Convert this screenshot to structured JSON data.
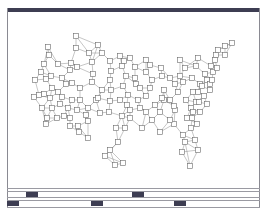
{
  "colors": {
    "frame": "#8a8a92",
    "bar": "#3d3d52",
    "node_stroke": "#6a6a6a",
    "edge": "#8c8c8c"
  },
  "nodes": [
    [
      76,
      36
    ],
    [
      48,
      47
    ],
    [
      49,
      55
    ],
    [
      44,
      64
    ],
    [
      41,
      72
    ],
    [
      35,
      80
    ],
    [
      46,
      79
    ],
    [
      51,
      76
    ],
    [
      62,
      78
    ],
    [
      66,
      84
    ],
    [
      52,
      88
    ],
    [
      34,
      97
    ],
    [
      44,
      94
    ],
    [
      50,
      98
    ],
    [
      58,
      92
    ],
    [
      62,
      97
    ],
    [
      72,
      100
    ],
    [
      72,
      83
    ],
    [
      70,
      70
    ],
    [
      77,
      67
    ],
    [
      76,
      48
    ],
    [
      71,
      63
    ],
    [
      89,
      53
    ],
    [
      98,
      45
    ],
    [
      102,
      53
    ],
    [
      92,
      62
    ],
    [
      93,
      74
    ],
    [
      92,
      82
    ],
    [
      80,
      88
    ],
    [
      80,
      100
    ],
    [
      96,
      100
    ],
    [
      102,
      90
    ],
    [
      100,
      113
    ],
    [
      98,
      98
    ],
    [
      88,
      108
    ],
    [
      77,
      110
    ],
    [
      68,
      108
    ],
    [
      60,
      104
    ],
    [
      52,
      108
    ],
    [
      47,
      118
    ],
    [
      46,
      124
    ],
    [
      57,
      118
    ],
    [
      64,
      116
    ],
    [
      70,
      118
    ],
    [
      78,
      126
    ],
    [
      70,
      126
    ],
    [
      88,
      121
    ],
    [
      110,
      61
    ],
    [
      111,
      71
    ],
    [
      110,
      80
    ],
    [
      111,
      90
    ],
    [
      110,
      101
    ],
    [
      109,
      112
    ],
    [
      120,
      56
    ],
    [
      124,
      61
    ],
    [
      130,
      58
    ],
    [
      122,
      66
    ],
    [
      126,
      76
    ],
    [
      123,
      86
    ],
    [
      128,
      95
    ],
    [
      127,
      105
    ],
    [
      122,
      116
    ],
    [
      136,
      84
    ],
    [
      146,
      60
    ],
    [
      135,
      78
    ],
    [
      146,
      72
    ],
    [
      135,
      67
    ],
    [
      161,
      68
    ],
    [
      146,
      96
    ],
    [
      150,
      88
    ],
    [
      152,
      80
    ],
    [
      155,
      105
    ],
    [
      160,
      112
    ],
    [
      170,
      100
    ],
    [
      175,
      84
    ],
    [
      183,
      82
    ],
    [
      178,
      92
    ],
    [
      162,
      76
    ],
    [
      170,
      78
    ],
    [
      180,
      76
    ],
    [
      185,
      68
    ],
    [
      198,
      58
    ],
    [
      192,
      78
    ],
    [
      196,
      66
    ],
    [
      186,
      100
    ],
    [
      191,
      108
    ],
    [
      198,
      92
    ],
    [
      200,
      84
    ],
    [
      205,
      74
    ],
    [
      211,
      66
    ],
    [
      216,
      55
    ],
    [
      218,
      50
    ],
    [
      225,
      46
    ],
    [
      232,
      43
    ],
    [
      225,
      55
    ],
    [
      213,
      72
    ],
    [
      207,
      80
    ],
    [
      210,
      84
    ],
    [
      196,
      102
    ],
    [
      192,
      118
    ],
    [
      175,
      110
    ],
    [
      174,
      124
    ],
    [
      183,
      135
    ],
    [
      170,
      120
    ],
    [
      160,
      132
    ],
    [
      152,
      120
    ],
    [
      142,
      128
    ],
    [
      125,
      128
    ],
    [
      130,
      118
    ],
    [
      140,
      108
    ],
    [
      116,
      128
    ],
    [
      118,
      142
    ],
    [
      110,
      150
    ],
    [
      115,
      165
    ],
    [
      123,
      163
    ],
    [
      105,
      156
    ],
    [
      88,
      138
    ],
    [
      86,
      115
    ],
    [
      79,
      132
    ],
    [
      187,
      118
    ],
    [
      191,
      128
    ],
    [
      195,
      140
    ],
    [
      198,
      150
    ],
    [
      190,
      166
    ],
    [
      185,
      142
    ],
    [
      182,
      152
    ],
    [
      193,
      112
    ],
    [
      199,
      102
    ],
    [
      204,
      96
    ],
    [
      210,
      90
    ],
    [
      212,
      80
    ],
    [
      202,
      86
    ],
    [
      200,
      112
    ],
    [
      197,
      124
    ],
    [
      217,
      68
    ],
    [
      215,
      60
    ],
    [
      207,
      104
    ],
    [
      193,
      92
    ],
    [
      174,
      106
    ],
    [
      164,
      90
    ],
    [
      164,
      100
    ],
    [
      180,
      60
    ],
    [
      162,
      98
    ],
    [
      150,
      65
    ],
    [
      146,
      112
    ],
    [
      138,
      100
    ],
    [
      130,
      110
    ],
    [
      120,
      100
    ],
    [
      140,
      88
    ],
    [
      58,
      64
    ],
    [
      42,
      108
    ],
    [
      39,
      95
    ]
  ],
  "bottom_rows": [
    {
      "marks": [
        [
          26,
          38
        ],
        [
          132,
          144
        ]
      ],
      "y": 192
    },
    {
      "marks": [
        [
          7,
          19
        ],
        [
          91,
          103
        ],
        [
          174,
          186
        ]
      ],
      "y": 201
    }
  ]
}
